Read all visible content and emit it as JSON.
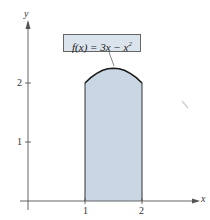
{
  "chart_data": {
    "type": "area",
    "title": "",
    "function_label": "f(x) = 3x − x²",
    "function_label_parts": {
      "lhs": "f(x) = 3x − x",
      "exp": "2"
    },
    "xlabel": "x",
    "ylabel": "y",
    "x_ticks": [
      "1",
      "2"
    ],
    "y_ticks": [
      "1",
      "2"
    ],
    "xlim": [
      0,
      2.4
    ],
    "ylim": [
      0,
      2.9
    ],
    "grid": false,
    "shaded_region": {
      "from": 1,
      "to": 2,
      "under": "f(x) = 3x - x^2"
    },
    "curve_points": {
      "x": [
        1.0,
        1.1,
        1.2,
        1.3,
        1.4,
        1.5,
        1.6,
        1.7,
        1.8,
        1.9,
        2.0
      ],
      "y": [
        2.0,
        2.09,
        2.16,
        2.21,
        2.24,
        2.25,
        2.24,
        2.21,
        2.16,
        2.09,
        2.0
      ]
    },
    "colors": {
      "fill": "#c9d6e3",
      "curve": "#1a1a1a",
      "axis": "#555555"
    }
  }
}
